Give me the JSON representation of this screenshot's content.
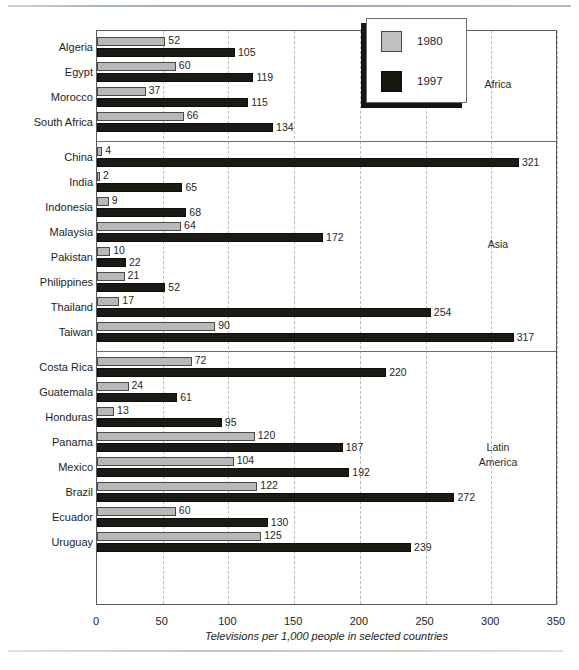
{
  "chart_data": {
    "type": "bar",
    "orientation": "horizontal",
    "title": "",
    "xlabel": "Televisions per 1,000 people in selected countries",
    "ylabel": "",
    "xlim": [
      0,
      350
    ],
    "xticks": [
      0,
      50,
      100,
      150,
      200,
      250,
      300,
      350
    ],
    "xtick_labels": [
      "0",
      "50",
      "100",
      "150",
      "200",
      "250",
      "300",
      "350"
    ],
    "grid": "vertical-dashed",
    "legend_position": "top-right-inside",
    "series": [
      {
        "name": "1980",
        "color": "#b8b8b8",
        "values": [
          52,
          60,
          37,
          66,
          4,
          2,
          9,
          64,
          10,
          21,
          17,
          90,
          72,
          24,
          13,
          120,
          104,
          122,
          60,
          125
        ]
      },
      {
        "name": "1997",
        "color": "#1b1a14",
        "values": [
          105,
          119,
          115,
          134,
          321,
          65,
          68,
          172,
          22,
          52,
          254,
          317,
          220,
          61,
          95,
          187,
          192,
          272,
          130,
          239
        ]
      }
    ],
    "categories": [
      "Algeria",
      "Egypt",
      "Morocco",
      "South  Africa",
      "China",
      "India",
      "Indonesia",
      "Malaysia",
      "Pakistan",
      "Philippines",
      "Thailand",
      "Taiwan",
      "Costa Rica",
      "Guatemala",
      "Honduras",
      "Panama",
      "Mexico",
      "Brazil",
      "Ecuador",
      "Uruguay"
    ],
    "groups": [
      {
        "label": "Africa",
        "start_index": 0,
        "count": 4
      },
      {
        "label": "Asia",
        "start_index": 4,
        "count": 8
      },
      {
        "label": "Latin\nAmerica",
        "start_index": 12,
        "count": 8
      }
    ],
    "group_labels": [
      {
        "name": "africa",
        "text": "Africa"
      },
      {
        "name": "asia",
        "text": "Asia"
      },
      {
        "name": "latin-america-line1",
        "text": "Latin"
      },
      {
        "name": "latin-america-line2",
        "text": "America"
      }
    ]
  },
  "legend": {
    "entries": [
      {
        "label": "1980",
        "color": "#b8b8b8"
      },
      {
        "label": "1997",
        "color": "#1b1a14"
      }
    ]
  },
  "axis": {
    "title": "Televisions per 1,000 people in selected countries",
    "ticks": [
      "0",
      "50",
      "100",
      "150",
      "200",
      "250",
      "300",
      "350"
    ]
  }
}
